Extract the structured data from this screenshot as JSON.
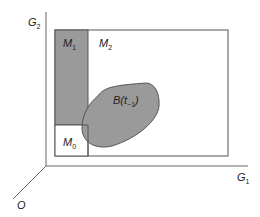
{
  "diagram": {
    "axes": {
      "vertical": {
        "label": "G",
        "subscript": "2"
      },
      "horizontal": {
        "label": "G",
        "subscript": "1"
      },
      "origin": {
        "label": "O"
      }
    },
    "regions": [
      {
        "id": "M1",
        "label": "M",
        "subscript": "1",
        "fill": "#9a9a9a"
      },
      {
        "id": "M2",
        "label": "M",
        "subscript": "2",
        "fill": "#ffffff"
      },
      {
        "id": "M0",
        "label": "M",
        "subscript": "0",
        "fill": "#ffffff"
      }
    ],
    "blob": {
      "label": "B(t",
      "subscript": "−1",
      "closing": ")",
      "fill": "#9a9a9a"
    },
    "colors": {
      "line": "#555555",
      "shade": "#9a9a9a",
      "background": "#ffffff"
    }
  }
}
